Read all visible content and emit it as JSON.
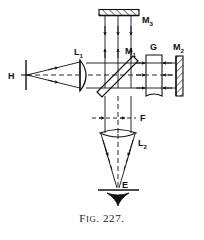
{
  "figure": {
    "caption_prefix": "F",
    "caption_smallcaps": "IG",
    "caption_dot": ".",
    "caption_number": "227.",
    "caption_full": "Fig. 227.",
    "type": "optics-ray-diagram"
  },
  "colors": {
    "ink": "#111111",
    "background": "#ffffff",
    "faint": "#6f7a96"
  },
  "labels": {
    "source": {
      "base": "H",
      "sub": "",
      "name": "source-slit"
    },
    "lens1": {
      "base": "L",
      "sub": "1",
      "name": "collimating-lens"
    },
    "mirror3": {
      "base": "M",
      "sub": "3",
      "name": "top-mirror"
    },
    "mirror1": {
      "base": "M",
      "sub": "1",
      "name": "beam-splitter"
    },
    "mirror2": {
      "base": "M",
      "sub": "2",
      "name": "right-mirror"
    },
    "plate": {
      "base": "G",
      "sub": "",
      "name": "compensating-plate"
    },
    "focal": {
      "base": "F",
      "sub": "",
      "name": "fringe-plane"
    },
    "lens2": {
      "base": "L",
      "sub": "2",
      "name": "viewing-lens"
    },
    "eye": {
      "base": "E",
      "sub": "",
      "name": "eye-point"
    }
  }
}
